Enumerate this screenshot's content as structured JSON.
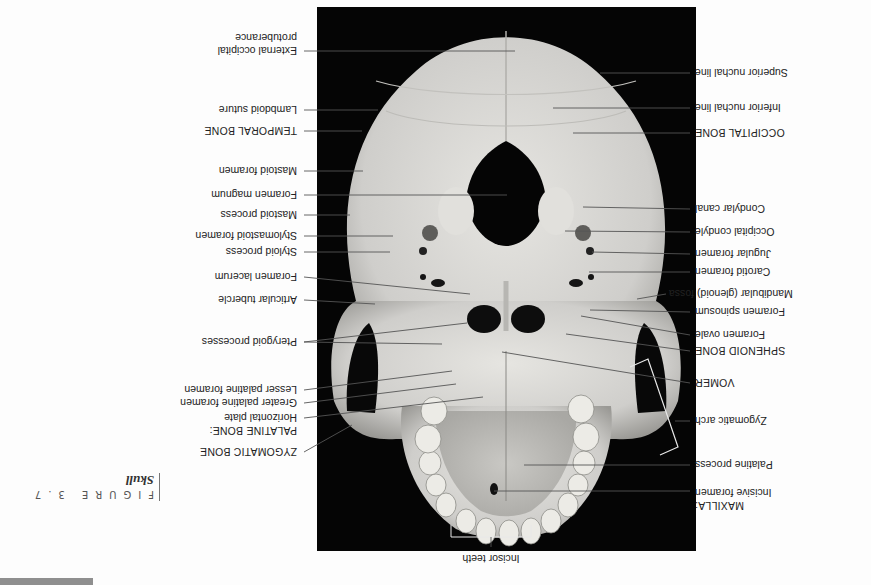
{
  "figure": {
    "number_label": "FIGURE 3.7",
    "title": "Skull",
    "orientation": "rotated 180 degrees",
    "view": "Inferior view of skull"
  },
  "labels_left_upright": [
    {
      "id": "maxilla_header",
      "text": "MAXILLA:",
      "caps": true
    },
    {
      "id": "incisive_foramen",
      "text": "Incisive foramen"
    },
    {
      "id": "palatine_process",
      "text": "Palatine process"
    },
    {
      "id": "zygomatic_arch",
      "text": "Zygomatic arch"
    },
    {
      "id": "vomer",
      "text": "VOMER",
      "caps": true
    },
    {
      "id": "sphenoid_bone",
      "text": "SPHENOID BONE",
      "caps": true
    },
    {
      "id": "foramen_ovale",
      "text": "Foramen ovale"
    },
    {
      "id": "foramen_spinosum",
      "text": "Foramen spinosum"
    },
    {
      "id": "mandibular_fossa",
      "text": "Mandibular (glenoid) fossa"
    },
    {
      "id": "carotid_foramen",
      "text": "Carotid foramen"
    },
    {
      "id": "jugular_foramen",
      "text": "Jugular foramen"
    },
    {
      "id": "occipital_condyle",
      "text": "Occipital condyle"
    },
    {
      "id": "condylar_canal",
      "text": "Condylar canal"
    },
    {
      "id": "occipital_bone",
      "text": "OCCIPITAL BONE",
      "caps": true
    },
    {
      "id": "inferior_nuchal_line",
      "text": "Inferior nuchal line"
    },
    {
      "id": "superior_nuchal_line",
      "text": "Superior nuchal line"
    }
  ],
  "labels_right_upright": [
    {
      "id": "zygomatic_bone",
      "text": "ZYGOMATIC BONE",
      "caps": true
    },
    {
      "id": "palatine_bone_header",
      "text": "PALATINE BONE:",
      "caps": true
    },
    {
      "id": "horizontal_plate",
      "text": "Horizontal plate"
    },
    {
      "id": "greater_palatine_foramen",
      "text": "Greater palatine foramen"
    },
    {
      "id": "lesser_palatine_foramen",
      "text": "Lesser palatine foramen"
    },
    {
      "id": "pterygoid_processes",
      "text": "Pterygoid processes"
    },
    {
      "id": "articular_tubercle",
      "text": "Articular tubercle"
    },
    {
      "id": "foramen_lacerum",
      "text": "Foramen lacerum"
    },
    {
      "id": "styloid_process",
      "text": "Styloid process"
    },
    {
      "id": "stylomastoid_foramen",
      "text": "Stylomastoid foramen"
    },
    {
      "id": "mastoid_process",
      "text": "Mastoid process"
    },
    {
      "id": "foramen_magnum",
      "text": "Foramen magnum"
    },
    {
      "id": "mastoid_foramen",
      "text": "Mastoid foramen"
    },
    {
      "id": "temporal_bone",
      "text": "TEMPORAL BONE",
      "caps": true
    },
    {
      "id": "lambdoid_suture",
      "text": "Lambdoid suture"
    },
    {
      "id": "external_occipital_protuberance_1",
      "text": "External occipital"
    },
    {
      "id": "external_occipital_protuberance_2",
      "text": "protuberance"
    }
  ],
  "labels_top_upright": [
    {
      "id": "incisor_teeth",
      "text": "Incisor teeth"
    }
  ],
  "colors": {
    "photo_background": "#050505",
    "bone": "#d9d9d6",
    "leader_line": "#555555",
    "bracket": "#e8e8e8",
    "gray_bar": "#8f8f8f"
  }
}
